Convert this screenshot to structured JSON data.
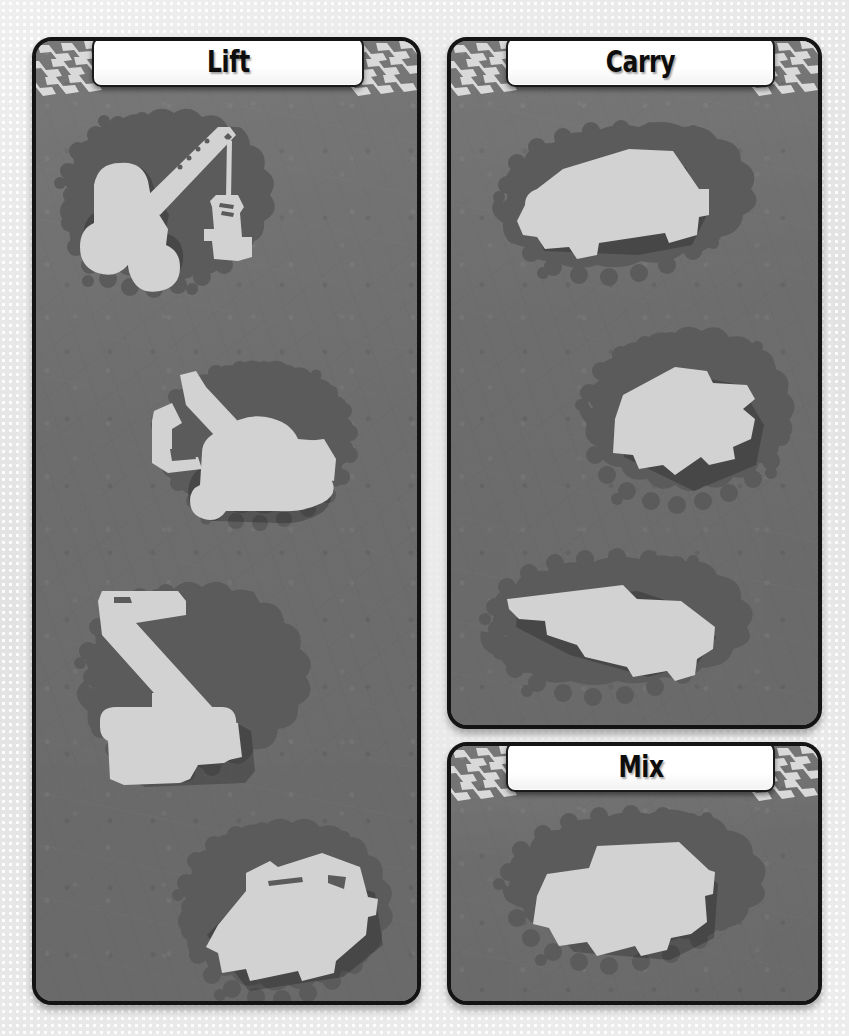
{
  "page": {
    "background_color": "#e8e8e8",
    "dot_pattern_color": "#ffffff"
  },
  "theme": {
    "panel_fill": "#6f6f6f",
    "panel_border": "#141414",
    "splat_color": "#5b5b5b",
    "silhouette_color": "#d2d2d2",
    "plate_fill": "#ffffff",
    "plate_border": "#1a1a1a",
    "title_text_color": "#0d0d0d",
    "tread_color": "#d8d8d8"
  },
  "panels": [
    {
      "id": "lift",
      "title": "Lift",
      "icon": "chevron-tread-icon",
      "items": [
        {
          "name": "crane-truck-silhouette",
          "label": "crane truck"
        },
        {
          "name": "excavator-silhouette",
          "label": "excavator"
        },
        {
          "name": "telehandler-silhouette",
          "label": "telehandler"
        },
        {
          "name": "forklift-silhouette",
          "label": "forklift"
        }
      ]
    },
    {
      "id": "carry",
      "title": "Carry",
      "icon": "chevron-tread-icon",
      "items": [
        {
          "name": "pickup-truck-silhouette",
          "label": "pickup truck"
        },
        {
          "name": "dump-truck-silhouette",
          "label": "dump truck"
        },
        {
          "name": "flatbed-truck-silhouette",
          "label": "flatbed truck"
        }
      ]
    },
    {
      "id": "mix",
      "title": "Mix",
      "icon": "chevron-tread-icon",
      "items": [
        {
          "name": "cement-mixer-silhouette",
          "label": "cement mixer truck"
        }
      ]
    }
  ]
}
